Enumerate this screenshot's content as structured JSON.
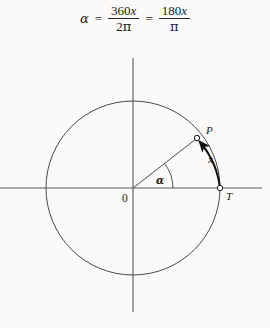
{
  "figure": {
    "kind": "unit-circle-radian-degree-diagram",
    "background_color": "#fbfaf8",
    "ink_color": "#242424"
  },
  "formula": {
    "lhs": "α",
    "rel1": "=",
    "frac1": {
      "numerator": "360x",
      "denominator": "2π"
    },
    "rel2": "=",
    "frac2": {
      "numerator": "180x",
      "denominator": "π"
    },
    "num1_digits": "360",
    "num1_var": "x",
    "den1_coef": "2",
    "den1_sym": "π",
    "num2_digits": "180",
    "num2_var": "x",
    "den2_sym": "π"
  },
  "diagram": {
    "axes": {
      "x_axis_label": "",
      "y_axis_label": "",
      "x_start": 0,
      "x_end": 262,
      "y_start": 58,
      "y_end": 312,
      "color": "#5a5a5a"
    },
    "circle": {
      "center_x": 133,
      "center_y": 188,
      "radius": 87,
      "stroke_color": "#4a4a4a"
    },
    "points": [
      {
        "id": "P",
        "label": "P",
        "x": 197,
        "y": 138,
        "label_x": 206,
        "label_y": 133,
        "marker": "open-circle"
      },
      {
        "id": "T",
        "label": "T",
        "x": 220,
        "y": 188,
        "label_x": 227,
        "label_y": 198,
        "marker": "open-circle"
      },
      {
        "id": "O",
        "label": "0",
        "x": 133,
        "y": 188,
        "label_x": 124,
        "label_y": 201,
        "marker": "none"
      }
    ],
    "radius_line": {
      "from": "O",
      "to": "P"
    },
    "arc": {
      "label": "x",
      "label_x": 211,
      "label_y": 160,
      "from": "T",
      "to": "P",
      "direction": "counterclockwise",
      "arrowhead_at": "P",
      "stroke_color": "#111111"
    },
    "angle": {
      "label": "α",
      "label_x": 158,
      "label_y": 182,
      "vertex": "O",
      "from_ray": "positive-x-axis",
      "to_ray": "radius-OP",
      "degrees": 38
    }
  }
}
